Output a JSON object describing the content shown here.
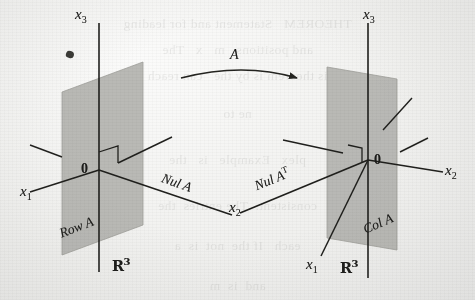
{
  "figure": {
    "caption_absent": true,
    "mapping_label": "A",
    "domain_space": {
      "space_label": "R",
      "space_exponent": "3",
      "axes": [
        {
          "name": "x",
          "index": "3"
        },
        {
          "name": "x",
          "index": "1"
        },
        {
          "name": "x",
          "index": "2"
        }
      ],
      "origin_label": "0",
      "plane_label": "Row A",
      "line_label": "Nul A",
      "line_label_base": "Nul A",
      "line_label_sup": ""
    },
    "codomain_space": {
      "space_label": "R",
      "space_exponent": "3",
      "axes": [
        {
          "name": "x",
          "index": "3"
        },
        {
          "name": "x",
          "index": "1"
        },
        {
          "name": "x",
          "index": "2"
        }
      ],
      "origin_label": "0",
      "plane_label": "Col A",
      "line_label_base": "Nul A",
      "line_label_sup": "T"
    }
  },
  "labels": {
    "left_x3": "x",
    "left_x3_sub": "3",
    "left_x1": "x",
    "left_x1_sub": "1",
    "left_x2": "x",
    "left_x2_sub": "2",
    "left_origin": "0",
    "left_plane": "Row A",
    "left_line": "Nul A",
    "left_space": "R",
    "left_space_sup": "3",
    "right_x3": "x",
    "right_x3_sub": "3",
    "right_x1": "x",
    "right_x1_sub": "1",
    "right_x2": "x",
    "right_x2_sub": "2",
    "right_origin": "0",
    "right_plane": "Col A",
    "right_line_base": "Nul A",
    "right_line_sup": "T",
    "right_space": "R",
    "right_space_sup": "3",
    "arrow_map": "A"
  },
  "ghost_text": {
    "lines": [
      "THEOREM   Statement and for leading",
      "and positions.  m   x   The",
      "is theorem is by the   can reach",
      "ne to",
      "plex   Example   is   the",
      "consistent.  The entries  the",
      "each   If the  not  is  a",
      "and  is  m"
    ]
  },
  "colors": {
    "paper": "#f2f2f0",
    "ink": "#1c1c1a",
    "plane_fill": "#b4b4b0",
    "plane_stroke": "#8f8f8b",
    "ghost_ink": "#40403c"
  }
}
